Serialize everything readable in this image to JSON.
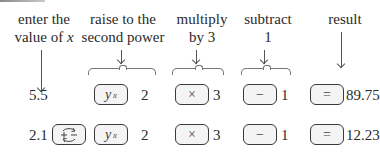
{
  "labels": {
    "enter": {
      "line1": "enter the",
      "line2": "value of ",
      "var": "x"
    },
    "raise": {
      "line1": "raise to the",
      "line2": "second power"
    },
    "multiply": {
      "line1": "multiply",
      "line2": "by 3"
    },
    "subtract": {
      "line1": "subtract",
      "line2": "1"
    },
    "result": {
      "line1": "result"
    }
  },
  "keys": {
    "power": {
      "base": "y",
      "exp": "x"
    },
    "multiply": "×",
    "subtract": "−",
    "equals": "=",
    "sign_change": "+/− (change sign)"
  },
  "rows": [
    {
      "input": "5.5",
      "exponent": "2",
      "multiplier": "3",
      "subtrahend": "1",
      "result": "89.75"
    },
    {
      "input": "2.1",
      "exponent": "2",
      "multiplier": "3",
      "subtrahend": "1",
      "result": "12.23"
    }
  ]
}
